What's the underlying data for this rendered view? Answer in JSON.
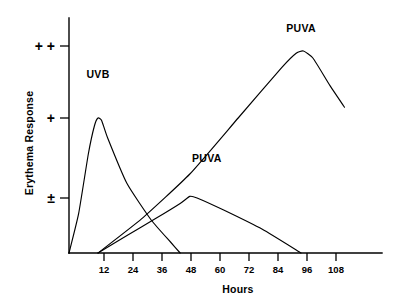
{
  "chart_data": {
    "type": "line",
    "title": "",
    "xlabel": "Hours",
    "ylabel": "Erythema Response",
    "xlim": [
      0,
      114
    ],
    "ylim": [
      0,
      3.35
    ],
    "grid": false,
    "legend_position": "inline-labels",
    "xticks": [
      12,
      24,
      36,
      48,
      60,
      72,
      84,
      96,
      108
    ],
    "xtick_labels": [
      "12",
      "24",
      "36",
      "48",
      "60",
      "72",
      "84",
      "96",
      "108"
    ],
    "yticks": [
      1,
      2,
      3
    ],
    "ytick_labels": [
      "±",
      "+",
      "+ +"
    ],
    "series": [
      {
        "name": "UVB",
        "label": "UVB",
        "label_x": 12,
        "label_y": 2.55,
        "points": [
          {
            "x": 0,
            "y": 0
          },
          {
            "x": 4,
            "y": 0.72
          },
          {
            "x": 8,
            "y": 1.55
          },
          {
            "x": 10.5,
            "y": 1.9
          },
          {
            "x": 12,
            "y": 2.0
          },
          {
            "x": 13.5,
            "y": 1.97
          },
          {
            "x": 16,
            "y": 1.75
          },
          {
            "x": 24,
            "y": 1.18
          },
          {
            "x": 34,
            "y": 0.6
          },
          {
            "x": 42,
            "y": 0.2
          },
          {
            "x": 46,
            "y": 0
          }
        ]
      },
      {
        "name": "PUVA-early",
        "label": "PUVA",
        "label_x": 57,
        "label_y": 1.45,
        "points": [
          {
            "x": 12,
            "y": 0
          },
          {
            "x": 24,
            "y": 0.32
          },
          {
            "x": 36,
            "y": 0.63
          },
          {
            "x": 46,
            "y": 0.9
          },
          {
            "x": 50,
            "y": 1.02
          },
          {
            "x": 53,
            "y": 1.0
          },
          {
            "x": 64,
            "y": 0.78
          },
          {
            "x": 80,
            "y": 0.43
          },
          {
            "x": 96,
            "y": 0
          }
        ]
      },
      {
        "name": "PUVA-late",
        "label": "PUVA",
        "label_x": 96,
        "label_y": 3.2,
        "points": [
          {
            "x": 12,
            "y": 0
          },
          {
            "x": 30,
            "y": 0.62
          },
          {
            "x": 50,
            "y": 1.3
          },
          {
            "x": 70,
            "y": 2.0
          },
          {
            "x": 88,
            "y": 2.7
          },
          {
            "x": 94,
            "y": 2.9
          },
          {
            "x": 97,
            "y": 2.93
          },
          {
            "x": 101,
            "y": 2.83
          },
          {
            "x": 108,
            "y": 2.45
          },
          {
            "x": 114,
            "y": 2.15
          }
        ]
      }
    ]
  },
  "axes": {
    "y_title": "Erythema Response",
    "x_title": "Hours"
  }
}
